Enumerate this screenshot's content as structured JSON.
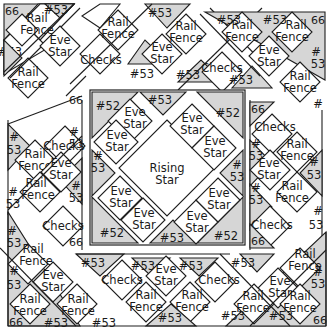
{
  "diagram": {
    "colors": {
      "shade": "#d6d6d6",
      "line": "#1e1e1e",
      "background": "#ffffff"
    },
    "center": {
      "label_line1": "Rising",
      "label_line2": "Star"
    },
    "labels": {
      "rail": "Rail",
      "fence": "Fence",
      "eve": "Eve",
      "star": "Star",
      "checks": "Checks",
      "n53": "#53",
      "n52": "#52",
      "n66": "66",
      "hash": "#",
      "n53b": "53"
    },
    "blocks": [
      "Rail Fence",
      "Eve Star",
      "Checks",
      "#53",
      "#52",
      "66",
      "Rising Star"
    ]
  }
}
